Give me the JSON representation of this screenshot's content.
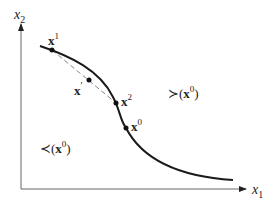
{
  "axes": {
    "x_label": "x",
    "x_sub": "1",
    "y_label": "x",
    "y_sub": "2"
  },
  "points": [
    {
      "id": "x1",
      "base": "x",
      "sup": "1"
    },
    {
      "id": "xprime",
      "base": "x",
      "sup": "′"
    },
    {
      "id": "x2",
      "base": "x",
      "sup": "2"
    },
    {
      "id": "x0",
      "base": "x",
      "sup": "0"
    }
  ],
  "regions": {
    "upper": {
      "rel": "≻",
      "open": "(",
      "base": "x",
      "sup": "0",
      "close": ")"
    },
    "lower": {
      "rel": "≺",
      "open": "(",
      "base": "x",
      "sup": "0",
      "close": ")"
    }
  },
  "colors": {
    "curve": "#1a1a1a",
    "axis": "#555555",
    "dashed": "#888888"
  }
}
